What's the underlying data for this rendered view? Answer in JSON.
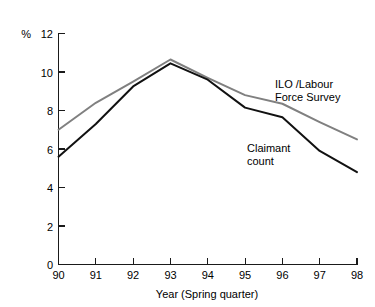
{
  "chart_data": {
    "type": "line",
    "title": "",
    "subtitle": "",
    "xlabel": "Year (Spring quarter)",
    "ylabel": "%",
    "unit_label": "%",
    "categories": [
      "90",
      "91",
      "92",
      "93",
      "94",
      "95",
      "96",
      "97",
      "98"
    ],
    "x": [
      90,
      91,
      92,
      93,
      94,
      95,
      96,
      97,
      98
    ],
    "xlim": [
      90,
      98
    ],
    "ylim": [
      0,
      12
    ],
    "y_ticks": [
      0,
      2,
      4,
      6,
      8,
      10,
      12
    ],
    "y_tick_labels": [
      "0",
      "2",
      "4",
      "6",
      "8",
      "10",
      "12"
    ],
    "x_ticks": [
      90,
      91,
      92,
      93,
      94,
      95,
      96,
      97,
      98
    ],
    "x_tick_labels": [
      "90",
      "91",
      "92",
      "93",
      "94",
      "95",
      "96",
      "97",
      "98"
    ],
    "grid": false,
    "legend_position": "inline-annotations",
    "series": [
      {
        "name": "ILO /Labour Force Survey",
        "color": "#808080",
        "values": [
          7.0,
          8.4,
          9.5,
          10.65,
          9.7,
          8.8,
          8.35,
          7.4,
          6.5
        ]
      },
      {
        "name": "Claimant count",
        "color": "#111111",
        "values": [
          5.6,
          7.3,
          9.25,
          10.45,
          9.6,
          8.15,
          7.65,
          5.9,
          4.8
        ]
      }
    ],
    "annotations": [
      {
        "id": "ilo-label",
        "lines": [
          "ILO /Labour",
          "Force Survey"
        ],
        "series": "ILO /Labour Force Survey"
      },
      {
        "id": "claimant-label",
        "lines": [
          "Claimant",
          "count"
        ],
        "series": "Claimant count"
      }
    ],
    "colors": {
      "ilo_line": "#808080",
      "claimant_line": "#111111",
      "axis": "#1a1a1a",
      "background": "#ffffff",
      "text": "#000000"
    }
  }
}
